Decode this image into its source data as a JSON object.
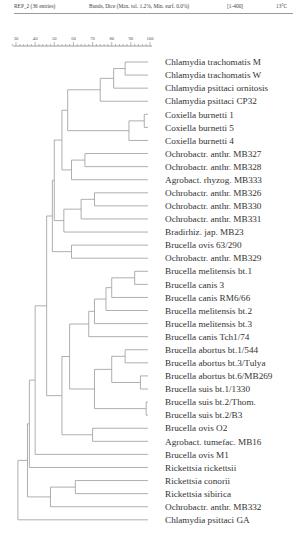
{
  "header": {
    "experiment": "REP_2 (36 entries)",
    "similarity": "Bands, Dice (Max. tol. 1.2%, Min. surf. 0.0%)",
    "range": "[1-400]",
    "temp": "13°C"
  },
  "chart_data": {
    "type": "dendrogram",
    "title": "REP_2 (36 entries)",
    "method": "Bands, Dice (Max. tol. 1.2%, Min. surf. 0.0%)",
    "scale": {
      "label": "similarity (%)",
      "ticks": [
        30,
        40,
        50,
        60,
        70,
        80,
        90,
        100
      ],
      "range": [
        30,
        100
      ]
    },
    "leaves": [
      "Chlamydia trachomatis M",
      "Chlamydia trachomatis W",
      "Chlamydia psittaci ornitosis",
      "Chlamydia psittaci CP32",
      "Coxiella burnetti 1",
      "Coxiella burnetti 5",
      "Coxiella burnetti 4",
      "Ochrobactr. anthr. MB327",
      "Ochrobactr. anthr. MB328",
      "Agrobact. rhyzog. MB333",
      "Ochrobactr. anthr. MB326",
      "Ochrobactr. anthr. MB330",
      "Ochrobactr. anthr. MB331",
      "Bradirhiz. jap. MB23",
      "Brucella ovis 63/290",
      "Ochrobactr. anthr. MB329",
      "Brucella melitensis bt.1",
      "Brucella canis 3",
      "Brucella canis RM6/66",
      "Brucella melitensis bt.2",
      "Brucella melitensis bt.3",
      "Brucella canis Tch1/74",
      "Brucella abortus bt.1/544",
      "Brucella abortus bt.3/Tulya",
      "Brucella abortus bt.6/MB269",
      "Brucella suis bt.1/1330",
      "Brucella suis bt.2/Thom.",
      "Brucella suis bt.2/B3",
      "Brucella ovis O2",
      "Agrobact. tumefac. MB16",
      "Brucella ovis M1",
      "Rickettsia rickettsii",
      "Rickettsia conorii",
      "Rickettsia sibirica",
      "Ochrobactr. anthr. MB332",
      "Chlamydia psittaci GA"
    ],
    "nodes": [
      {
        "id": "n1",
        "children": [
          "L0",
          "L1"
        ],
        "sim": 87
      },
      {
        "id": "n2",
        "children": [
          "n1",
          "L2"
        ],
        "sim": 81
      },
      {
        "id": "n3",
        "children": [
          "n2",
          "L3"
        ],
        "sim": 74
      },
      {
        "id": "n4",
        "children": [
          "L4",
          "L5"
        ],
        "sim": 97
      },
      {
        "id": "n5",
        "children": [
          "n4",
          "L6"
        ],
        "sim": 89
      },
      {
        "id": "n6",
        "children": [
          "n3",
          "n5"
        ],
        "sim": 57
      },
      {
        "id": "n7",
        "children": [
          "L7",
          "L8"
        ],
        "sim": 66
      },
      {
        "id": "n8",
        "children": [
          "n7",
          "L9"
        ],
        "sim": 59
      },
      {
        "id": "n9",
        "children": [
          "n6",
          "n8"
        ],
        "sim": 54
      },
      {
        "id": "n10",
        "children": [
          "L10",
          "L11"
        ],
        "sim": 71
      },
      {
        "id": "n11",
        "children": [
          "n10",
          "L12"
        ],
        "sim": 64
      },
      {
        "id": "n12",
        "children": [
          "n11",
          "L13"
        ],
        "sim": 55
      },
      {
        "id": "n13",
        "children": [
          "n9",
          "n12"
        ],
        "sim": 50
      },
      {
        "id": "n14",
        "children": [
          "L14",
          "L15"
        ],
        "sim": 59
      },
      {
        "id": "n15",
        "children": [
          "n13",
          "n14"
        ],
        "sim": 49
      },
      {
        "id": "n16",
        "children": [
          "L16",
          "L17"
        ],
        "sim": 92
      },
      {
        "id": "n17",
        "children": [
          "n16",
          "L18"
        ],
        "sim": 80
      },
      {
        "id": "n18",
        "children": [
          "n17",
          "L19"
        ],
        "sim": 77
      },
      {
        "id": "n19",
        "children": [
          "n18",
          "L20"
        ],
        "sim": 71
      },
      {
        "id": "n20",
        "children": [
          "n19",
          "L21"
        ],
        "sim": 68
      },
      {
        "id": "n21",
        "children": [
          "L22",
          "L23"
        ],
        "sim": 87
      },
      {
        "id": "n22",
        "children": [
          "L24",
          "L25"
        ],
        "sim": 95
      },
      {
        "id": "n23",
        "children": [
          "n21",
          "n22"
        ],
        "sim": 80
      },
      {
        "id": "n24",
        "children": [
          "L26",
          "L27"
        ],
        "sim": 98
      },
      {
        "id": "n25",
        "children": [
          "n23",
          "n24"
        ],
        "sim": 71
      },
      {
        "id": "n26",
        "children": [
          "n20",
          "n25"
        ],
        "sim": 58
      },
      {
        "id": "n27",
        "children": [
          "L28",
          "L29"
        ],
        "sim": 70
      },
      {
        "id": "n28",
        "children": [
          "n26",
          "n27"
        ],
        "sim": 54
      },
      {
        "id": "n29",
        "children": [
          "n15",
          "n28"
        ],
        "sim": 46
      },
      {
        "id": "n30",
        "children": [
          "n29",
          "L30"
        ],
        "sim": 40
      },
      {
        "id": "n31",
        "children": [
          "n30",
          "L31"
        ],
        "sim": 37
      },
      {
        "id": "n32",
        "children": [
          "L32",
          "L33"
        ],
        "sim": 61
      },
      {
        "id": "n33",
        "children": [
          "n32",
          "L34"
        ],
        "sim": 48
      },
      {
        "id": "n34",
        "children": [
          "n31",
          "n33"
        ],
        "sim": 36
      },
      {
        "id": "n35",
        "children": [
          "n34",
          "L35"
        ],
        "sim": 31
      }
    ]
  }
}
